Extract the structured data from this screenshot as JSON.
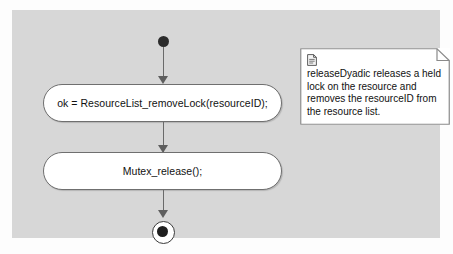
{
  "diagram": {
    "type": "uml-activity-diagram",
    "canvas_background": "#d7d7d7",
    "page_background": "#fdfdfd",
    "node_stroke": "#6f6f6f",
    "node_fill": "#ffffff",
    "marker_fill": "#1e1e1e"
  },
  "nodes": {
    "start": {
      "name": "initial-node",
      "shape": "filled-circle"
    },
    "activity_1": {
      "label": "ok = ResourceList_removeLock(resourceID);",
      "shape": "rounded-rectangle"
    },
    "activity_2": {
      "label": "Mutex_release();",
      "shape": "rounded-rectangle"
    },
    "end": {
      "name": "final-node",
      "shape": "bullseye"
    }
  },
  "note": {
    "icon": "document-icon",
    "text": "releaseDyadic releases a held lock on the resource and removes the resourceID from the resource list.",
    "lines": [
      "releaseDyadic releases a held",
      "lock on the resource and",
      "removes the resourceID from",
      "the resource list."
    ]
  },
  "edges": [
    {
      "from": "start",
      "to": "activity_1",
      "arrow": "solid-filled"
    },
    {
      "from": "activity_1",
      "to": "activity_2",
      "arrow": "solid-filled"
    },
    {
      "from": "activity_2",
      "to": "end",
      "arrow": "solid-filled"
    }
  ]
}
